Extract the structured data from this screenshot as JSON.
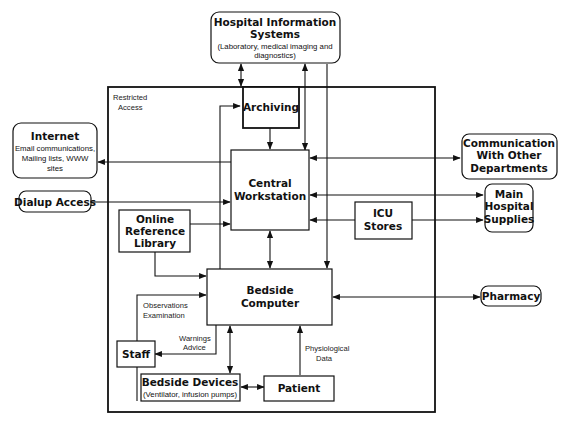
{
  "diagram": {
    "boundary_label": [
      "Restricted",
      "Access"
    ],
    "nodes": {
      "his": {
        "title": [
          "Hospital Information",
          "Systems"
        ],
        "subtitle": [
          "(Laboratory, medical imaging and",
          "diagnostics)"
        ]
      },
      "internet": {
        "title": [
          "Internet"
        ],
        "subtitle": [
          "Email communications,",
          "Mailing lists, WWW",
          "sites"
        ]
      },
      "dialup": {
        "title": [
          "Dialup Access"
        ]
      },
      "archiving": {
        "title": [
          "Archiving"
        ]
      },
      "central": {
        "title": [
          "Central",
          "Workstation"
        ]
      },
      "comm": {
        "title": [
          "Communication",
          "With Other",
          "Departments"
        ]
      },
      "icu": {
        "title": [
          "ICU",
          "Stores"
        ]
      },
      "supplies": {
        "title": [
          "Main",
          "Hospital",
          "Supplies"
        ]
      },
      "library": {
        "title": [
          "Online",
          "Reference",
          "Library"
        ]
      },
      "bedside_computer": {
        "title": [
          "Bedside",
          "Computer"
        ]
      },
      "pharmacy": {
        "title": [
          "Pharmacy"
        ]
      },
      "staff": {
        "title": [
          "Staff"
        ]
      },
      "bedside_devices": {
        "title": [
          "Bedside Devices"
        ],
        "subtitle": [
          "(Ventilator, infusion pumps)"
        ]
      },
      "patient": {
        "title": [
          "Patient"
        ]
      }
    },
    "edge_labels": {
      "observations": [
        "Observations",
        "Examination"
      ],
      "warnings": [
        "Warnings",
        "Advice"
      ],
      "physiological": [
        "Physiological",
        "Data"
      ]
    }
  }
}
